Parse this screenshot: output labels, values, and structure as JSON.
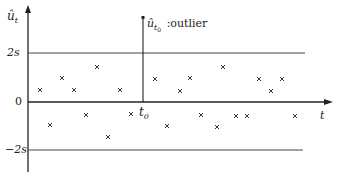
{
  "chart_data": {
    "type": "scatter",
    "title": "",
    "xlabel": "t",
    "ylabel": "û_t",
    "y_ticks": [
      "2s",
      "0",
      "-2s"
    ],
    "y_tick_values": [
      2,
      0,
      -2
    ],
    "ylim": [
      -2.8,
      3.4
    ],
    "reference_lines": [
      {
        "label": "2s",
        "value": 2
      },
      {
        "label": "0",
        "value": 0
      },
      {
        "label": "-2s",
        "value": -2
      }
    ],
    "outlier": {
      "label": "û_t0 :outlier",
      "x_label": "t0",
      "value": 3.4
    },
    "points_px": [
      [
        40,
        90
      ],
      [
        50,
        125
      ],
      [
        62,
        78
      ],
      [
        74,
        90
      ],
      [
        86,
        115
      ],
      [
        97,
        67
      ],
      [
        108,
        137
      ],
      [
        120,
        90
      ],
      [
        131,
        114
      ],
      [
        155,
        79
      ],
      [
        167,
        126
      ],
      [
        180,
        91
      ],
      [
        190,
        78
      ],
      [
        201,
        115
      ],
      [
        217,
        127
      ],
      [
        223,
        67
      ],
      [
        236,
        116
      ],
      [
        247,
        116
      ],
      [
        259,
        79
      ],
      [
        271,
        91
      ],
      [
        282,
        79
      ],
      [
        295,
        116
      ]
    ],
    "grid": false,
    "legend": null
  },
  "labels": {
    "y_axis": "û",
    "y_axis_sub": "t",
    "x_axis": "t",
    "tick_2s": "2s",
    "tick_0": "0",
    "tick_neg2s": "−2s",
    "t0": "t",
    "t0_sub": "0",
    "outlier_hat": "û",
    "outlier_sub": "t",
    "outlier_subsub": "0",
    "outlier_text": ":outlier"
  },
  "colors": {
    "axis": "#222222",
    "ref_line": "#444444",
    "point": "#333333"
  }
}
